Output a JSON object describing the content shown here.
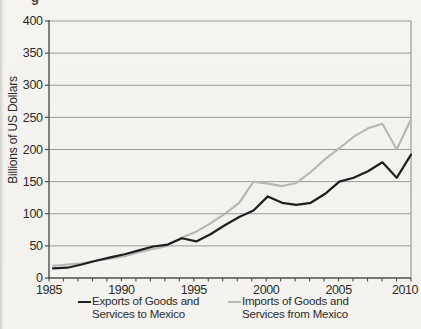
{
  "figure": {
    "clipped_caption_fragment": "g"
  },
  "chart_data": {
    "type": "line",
    "title": "",
    "xlabel": "",
    "ylabel": "Billions of US Dollars",
    "ylim": [
      0,
      400
    ],
    "y_ticks": [
      0,
      50,
      100,
      150,
      200,
      250,
      300,
      350,
      400
    ],
    "x_range": [
      1985,
      2010
    ],
    "x_tick_labels": [
      "1985",
      "1990",
      "1995",
      "2000",
      "2005",
      "2010"
    ],
    "grid": "horizontal",
    "legend_position": "bottom",
    "axis_color": "#4f4f4f",
    "grid_color": "#9a9a9a",
    "tick_label_color": "#2b2b2b",
    "years": [
      1985,
      1986,
      1987,
      1988,
      1989,
      1990,
      1991,
      1992,
      1993,
      1994,
      1995,
      1996,
      1997,
      1998,
      1999,
      2000,
      2001,
      2002,
      2003,
      2004,
      2005,
      2006,
      2007,
      2008,
      2009,
      2010
    ],
    "series": [
      {
        "name": "Exports of Goods and Services to Mexico",
        "legend_lines": [
          "Exports of Goods and",
          "Services to Mexico"
        ],
        "color": "#1f1f1f",
        "values": [
          15,
          16,
          21,
          27,
          32,
          37,
          43,
          49,
          52,
          62,
          57,
          68,
          82,
          95,
          105,
          127,
          117,
          114,
          117,
          131,
          150,
          156,
          166,
          180,
          156,
          192
        ]
      },
      {
        "name": "Imports of Goods and Services from Mexico",
        "legend_lines": [
          "Imports of Goods and",
          "Services from Mexico"
        ],
        "color": "#b7b6b4",
        "values": [
          19,
          21,
          23,
          27,
          30,
          34,
          40,
          45,
          50,
          63,
          72,
          85,
          100,
          117,
          150,
          147,
          143,
          148,
          165,
          185,
          202,
          220,
          233,
          240,
          200,
          247
        ]
      }
    ]
  }
}
